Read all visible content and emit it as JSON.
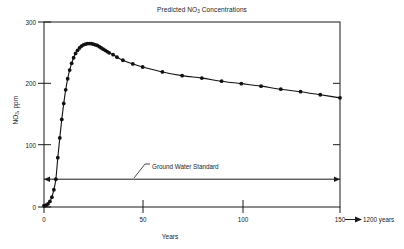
{
  "chart_data": {
    "type": "line",
    "title": "Predicted NO3 Concentrations",
    "title_main": "Predicted NO",
    "title_sub": "3",
    "title_tail": " Concentrations",
    "xlabel": "Years",
    "ylabel_main": "NO",
    "ylabel_sub": "3",
    "ylabel_tail": ", ppm",
    "ylabel": "NO3, ppm",
    "xlim": [
      0,
      150
    ],
    "ylim": [
      0,
      300
    ],
    "xticks": [
      0,
      50,
      100,
      150
    ],
    "xtick_labels": [
      "0",
      "50",
      "100",
      "150"
    ],
    "yticks": [
      0,
      100,
      200,
      300
    ],
    "ytick_labels": [
      "0",
      "100",
      "200",
      "300"
    ],
    "grid": false,
    "legend": "none",
    "axis_break_note": "150 → 1200 years",
    "axis_break_value": "1200 years",
    "series": [
      {
        "name": "Predicted NO3 concentration",
        "marker": "filled-circle",
        "x": [
          0,
          1,
          2,
          3,
          4,
          5,
          6,
          7,
          8,
          9,
          10,
          11,
          12,
          13,
          14,
          15,
          16,
          17,
          18,
          19,
          20,
          21,
          22,
          23,
          24,
          25,
          26,
          27,
          28,
          29,
          30,
          31,
          32,
          33,
          35,
          37,
          40,
          45,
          50,
          60,
          70,
          80,
          90,
          100,
          110,
          120,
          130,
          140,
          150
        ],
        "y": [
          2,
          3,
          5,
          9,
          16,
          28,
          45,
          80,
          112,
          142,
          168,
          190,
          208,
          222,
          233,
          242,
          249,
          254,
          258,
          261,
          263,
          264,
          265,
          265,
          265,
          264,
          263,
          262,
          260,
          258,
          256,
          254,
          252,
          250,
          247,
          243,
          238,
          232,
          227,
          219,
          213,
          209,
          204,
          200,
          196,
          191,
          187,
          182,
          177
        ]
      }
    ],
    "annotations": [
      {
        "name": "ground-water-standard",
        "text": "Ground Water Standard",
        "type": "horizontal-line",
        "value": 45,
        "x_text": 50,
        "y_text": 95
      }
    ]
  },
  "colors": {
    "axis": "#1a1a1a",
    "curve": "#111111",
    "marker": "#111111",
    "standard_line": "#1a1a1a",
    "background": "#ffffff"
  }
}
